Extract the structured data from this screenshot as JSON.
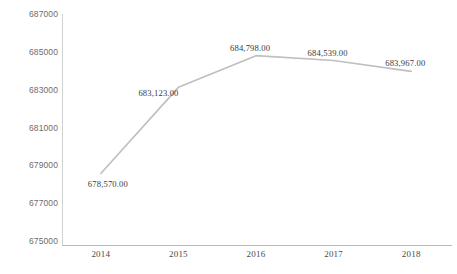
{
  "chart_data": {
    "type": "line",
    "title": "",
    "xlabel": "",
    "ylabel": "",
    "categories": [
      "2014",
      "2015",
      "2016",
      "2017",
      "2018"
    ],
    "values": [
      678570.0,
      683123.0,
      684798.0,
      684539.0,
      683967.0
    ],
    "point_labels": [
      "678,570.00",
      "683,123.00",
      "684,798.00",
      "684,539.00",
      "683,967.00"
    ],
    "ylim": [
      675000,
      687000
    ],
    "y_ticks": [
      675000,
      677000,
      679000,
      681000,
      683000,
      685000,
      687000
    ],
    "y_tick_labels": [
      "675000",
      "677000",
      "679000",
      "681000",
      "683000",
      "685000",
      "687000"
    ],
    "grid": false,
    "legend": "none",
    "series": [
      {
        "name": "series-1",
        "values": [
          678570.0,
          683123.0,
          684798.0,
          684539.0,
          683967.0
        ],
        "color": "#bfbfbf",
        "marker": "none"
      }
    ],
    "colors": {
      "line": "#bfbfbf",
      "axis": "#b9b9b9",
      "y_tick_text": "#6d6d6d",
      "x_tick_text": "#4a4a4a",
      "label_text": "#3a3a3a",
      "background": "#ffffff"
    }
  }
}
